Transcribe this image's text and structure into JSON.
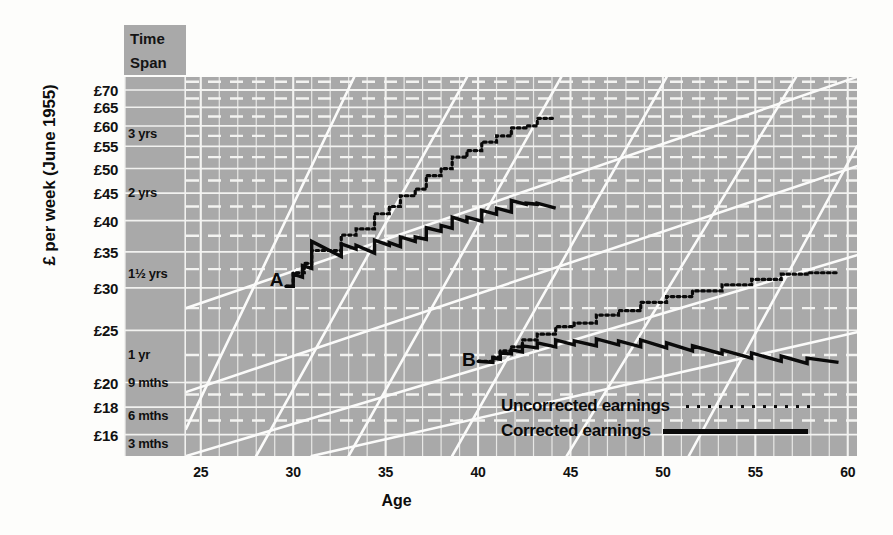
{
  "chart_data": {
    "type": "line",
    "title": "",
    "xlabel": "Age",
    "ylabel": "£ per week (June 1955)",
    "xlim": [
      24.2,
      60.5
    ],
    "ylim": [
      14.6,
      74.0
    ],
    "yscale": "log",
    "grid": true,
    "legend_position": "bottom-right",
    "x_ticks": [
      25,
      30,
      35,
      40,
      45,
      50,
      55,
      60
    ],
    "y_ticks": [
      16,
      18,
      20,
      25,
      30,
      35,
      40,
      45,
      50,
      55,
      60,
      65,
      70
    ],
    "y_tick_labels": [
      "£16",
      "£18",
      "£20",
      "£25",
      "£30",
      "£35",
      "£40",
      "£45",
      "£50",
      "£55",
      "£60",
      "£65",
      "£70"
    ],
    "time_span_axis": {
      "header": "Time Span",
      "ticks": [
        {
          "label": "3 yrs",
          "value": 58.0
        },
        {
          "label": "2 yrs",
          "value": 45.0
        },
        {
          "label": "1½ yrs",
          "value": 31.8
        },
        {
          "label": "1 yr",
          "value": 22.5
        },
        {
          "label": "9 mths",
          "value": 20.0
        },
        {
          "label": "6 mths",
          "value": 17.3
        },
        {
          "label": "3 mths",
          "value": 15.4
        }
      ]
    },
    "annotations": [
      {
        "text": "A",
        "x": 29.6,
        "y": 31.0
      },
      {
        "text": "B",
        "x": 40.0,
        "y": 22.0
      }
    ],
    "series": [
      {
        "name": "Uncorrected earnings",
        "style": "dotted",
        "color": "#0a0a0a",
        "track": "A",
        "points": [
          [
            29.6,
            30.2
          ],
          [
            30.0,
            30.2
          ],
          [
            30.0,
            32.0
          ],
          [
            30.6,
            32.0
          ],
          [
            30.6,
            33.3
          ],
          [
            31.0,
            33.3
          ],
          [
            31.0,
            35.2
          ],
          [
            32.6,
            35.2
          ],
          [
            32.6,
            37.6
          ],
          [
            33.4,
            37.6
          ],
          [
            33.4,
            38.6
          ],
          [
            34.4,
            38.6
          ],
          [
            34.4,
            41.2
          ],
          [
            35.2,
            41.2
          ],
          [
            35.2,
            42.5
          ],
          [
            35.8,
            42.5
          ],
          [
            35.8,
            44.5
          ],
          [
            36.6,
            44.5
          ],
          [
            36.6,
            45.8
          ],
          [
            37.2,
            45.8
          ],
          [
            37.2,
            48.5
          ],
          [
            38.0,
            48.5
          ],
          [
            38.0,
            50.0
          ],
          [
            38.6,
            50.0
          ],
          [
            38.6,
            52.5
          ],
          [
            39.4,
            52.5
          ],
          [
            39.4,
            54.0
          ],
          [
            40.2,
            54.0
          ],
          [
            40.2,
            56.0
          ],
          [
            41.0,
            56.0
          ],
          [
            41.0,
            57.5
          ],
          [
            41.8,
            57.5
          ],
          [
            41.8,
            59.5
          ],
          [
            42.6,
            59.5
          ],
          [
            42.6,
            60.0
          ],
          [
            43.2,
            60.0
          ],
          [
            43.2,
            62.0
          ],
          [
            44.2,
            62.0
          ]
        ]
      },
      {
        "name": "Corrected earnings",
        "style": "solid",
        "color": "#0a0a0a",
        "track": "A",
        "points": [
          [
            29.6,
            30.2
          ],
          [
            30.0,
            30.2
          ],
          [
            30.0,
            31.8
          ],
          [
            30.5,
            31.4
          ],
          [
            30.5,
            33.0
          ],
          [
            31.0,
            32.6
          ],
          [
            31.0,
            36.6
          ],
          [
            32.6,
            34.3
          ],
          [
            32.6,
            36.2
          ],
          [
            33.4,
            35.4
          ],
          [
            33.4,
            36.0
          ],
          [
            34.4,
            34.8
          ],
          [
            34.4,
            36.8
          ],
          [
            35.2,
            36.0
          ],
          [
            35.2,
            36.4
          ],
          [
            35.8,
            35.8
          ],
          [
            35.8,
            37.3
          ],
          [
            36.6,
            36.6
          ],
          [
            36.6,
            37.3
          ],
          [
            37.2,
            36.9
          ],
          [
            37.2,
            38.8
          ],
          [
            38.0,
            38.2
          ],
          [
            38.0,
            39.2
          ],
          [
            38.6,
            38.7
          ],
          [
            38.6,
            40.6
          ],
          [
            39.4,
            39.8
          ],
          [
            39.4,
            40.6
          ],
          [
            40.2,
            39.9
          ],
          [
            40.2,
            41.8
          ],
          [
            41.0,
            41.1
          ],
          [
            41.0,
            42.2
          ],
          [
            41.8,
            41.5
          ],
          [
            41.8,
            43.6
          ],
          [
            42.6,
            42.9
          ],
          [
            42.6,
            43.1
          ],
          [
            43.2,
            42.9
          ],
          [
            43.2,
            43.1
          ],
          [
            44.2,
            42.2
          ]
        ]
      },
      {
        "name": "Uncorrected earnings",
        "style": "dotted",
        "color": "#0a0a0a",
        "track": "B",
        "points": [
          [
            40.0,
            21.9
          ],
          [
            40.8,
            21.9
          ],
          [
            40.8,
            22.3
          ],
          [
            41.2,
            22.3
          ],
          [
            41.2,
            22.9
          ],
          [
            41.8,
            22.9
          ],
          [
            41.8,
            23.3
          ],
          [
            42.4,
            23.3
          ],
          [
            42.4,
            24.0
          ],
          [
            43.2,
            24.0
          ],
          [
            43.2,
            24.6
          ],
          [
            44.2,
            24.6
          ],
          [
            44.2,
            25.4
          ],
          [
            45.2,
            25.4
          ],
          [
            45.2,
            25.8
          ],
          [
            46.4,
            25.8
          ],
          [
            46.4,
            26.7
          ],
          [
            47.6,
            26.7
          ],
          [
            47.6,
            27.2
          ],
          [
            48.8,
            27.2
          ],
          [
            48.8,
            28.2
          ],
          [
            50.2,
            28.2
          ],
          [
            50.2,
            28.9
          ],
          [
            51.6,
            28.9
          ],
          [
            51.6,
            29.6
          ],
          [
            53.2,
            29.6
          ],
          [
            53.2,
            30.4
          ],
          [
            54.8,
            30.4
          ],
          [
            54.8,
            31.1
          ],
          [
            56.4,
            31.1
          ],
          [
            56.4,
            31.8
          ],
          [
            57.8,
            31.8
          ],
          [
            57.8,
            32.0
          ],
          [
            59.5,
            32.0
          ]
        ]
      },
      {
        "name": "Corrected earnings",
        "style": "solid",
        "color": "#0a0a0a",
        "track": "B",
        "points": [
          [
            40.0,
            21.9
          ],
          [
            40.8,
            21.8
          ],
          [
            40.8,
            22.2
          ],
          [
            41.2,
            22.1
          ],
          [
            41.2,
            22.7
          ],
          [
            41.8,
            22.6
          ],
          [
            41.8,
            23.0
          ],
          [
            42.4,
            22.8
          ],
          [
            42.4,
            23.4
          ],
          [
            43.2,
            23.2
          ],
          [
            43.2,
            23.7
          ],
          [
            44.2,
            23.3
          ],
          [
            44.2,
            24.0
          ],
          [
            45.2,
            23.5
          ],
          [
            45.2,
            23.9
          ],
          [
            46.4,
            23.4
          ],
          [
            46.4,
            24.1
          ],
          [
            47.6,
            23.5
          ],
          [
            47.6,
            23.9
          ],
          [
            48.8,
            23.3
          ],
          [
            48.8,
            24.0
          ],
          [
            50.2,
            23.2
          ],
          [
            50.2,
            23.7
          ],
          [
            51.6,
            22.9
          ],
          [
            51.6,
            23.4
          ],
          [
            53.2,
            22.6
          ],
          [
            53.2,
            23.0
          ],
          [
            54.8,
            22.2
          ],
          [
            54.8,
            22.7
          ],
          [
            56.4,
            21.9
          ],
          [
            56.4,
            22.4
          ],
          [
            57.8,
            21.7
          ],
          [
            57.8,
            22.2
          ],
          [
            59.5,
            21.8
          ]
        ]
      }
    ],
    "reference_lines": {
      "description": "white diagonal constant-growth guide lines",
      "steep": [
        {
          "x1": 24.2,
          "y1": 16.4,
          "x2": 33.3,
          "y2": 74.0
        },
        {
          "x1": 28.0,
          "y1": 14.6,
          "x2": 39.4,
          "y2": 74.0
        },
        {
          "x1": 33.0,
          "y1": 14.6,
          "x2": 44.5,
          "y2": 74.0
        },
        {
          "x1": 38.6,
          "y1": 14.6,
          "x2": 50.2,
          "y2": 74.0
        },
        {
          "x1": 44.8,
          "y1": 14.6,
          "x2": 57.2,
          "y2": 74.0
        },
        {
          "x1": 51.4,
          "y1": 14.6,
          "x2": 60.5,
          "y2": 55.0
        }
      ],
      "shallow": [
        {
          "x1": 24.2,
          "y1": 27.5,
          "x2": 60.5,
          "y2": 74.0
        },
        {
          "x1": 24.2,
          "y1": 19.2,
          "x2": 60.5,
          "y2": 50.5
        },
        {
          "x1": 24.2,
          "y1": 14.6,
          "x2": 60.5,
          "y2": 34.5
        },
        {
          "x1": 31.0,
          "y1": 14.6,
          "x2": 60.5,
          "y2": 24.8
        }
      ]
    }
  },
  "legend": {
    "uncorrected": "Uncorrected earnings",
    "corrected": "Corrected earnings"
  }
}
